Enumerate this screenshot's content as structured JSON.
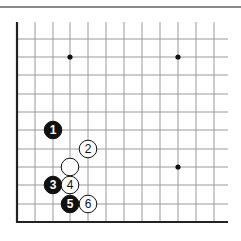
{
  "diagram": {
    "type": "go-board-corner",
    "grid": {
      "x_lines": [
        17,
        35,
        53,
        70,
        88,
        106,
        124,
        142,
        160,
        178,
        196,
        214
      ],
      "y_lines": [
        39,
        57,
        75,
        94,
        112,
        130,
        149,
        167,
        185,
        204,
        222
      ],
      "line_x_end": 228,
      "line_y_start": 22,
      "line_color": "#9a9a9a",
      "border_color": "#222222"
    },
    "star_points": [
      {
        "col": 3,
        "row": 1
      },
      {
        "col": 9,
        "row": 1
      },
      {
        "col": 9,
        "row": 7
      }
    ],
    "stones": [
      {
        "color": "black",
        "label": "1",
        "col": 2,
        "row": 5
      },
      {
        "color": "white",
        "label": "2",
        "col": 4,
        "row": 6
      },
      {
        "color": "white",
        "label": "",
        "col": 3,
        "row": 7
      },
      {
        "color": "black",
        "label": "3",
        "col": 2,
        "row": 8
      },
      {
        "color": "white",
        "label": "4",
        "col": 3,
        "row": 8
      },
      {
        "color": "black",
        "label": "5",
        "col": 3,
        "row": 9
      },
      {
        "color": "white",
        "label": "6",
        "col": 4,
        "row": 9
      }
    ]
  }
}
